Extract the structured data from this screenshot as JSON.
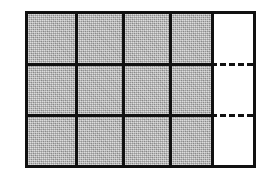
{
  "figure": {
    "name": "fraction-area-grid",
    "columns": 5,
    "rows": 3,
    "total_cells": 15,
    "shaded_cells": 12,
    "unshaded_cells": 3,
    "shaded_fraction": "12/15",
    "frame_color": "#111111",
    "shaded_color": "#bdbdbd",
    "unshaded_color": "#ffffff",
    "background_color": "#ffffff",
    "solid_divider_style": "solid",
    "dashed_divider_style": "dashed",
    "cells": [
      [
        {
          "id": "r1c1",
          "shaded": true,
          "divider_top": "none",
          "divider_left": "none"
        },
        {
          "id": "r1c2",
          "shaded": true,
          "divider_top": "none",
          "divider_left": "solid"
        },
        {
          "id": "r1c3",
          "shaded": true,
          "divider_top": "none",
          "divider_left": "solid"
        },
        {
          "id": "r1c4",
          "shaded": true,
          "divider_top": "none",
          "divider_left": "solid"
        },
        {
          "id": "r1c5",
          "shaded": false,
          "divider_top": "none",
          "divider_left": "solid"
        }
      ],
      [
        {
          "id": "r2c1",
          "shaded": true,
          "divider_top": "solid",
          "divider_left": "none"
        },
        {
          "id": "r2c2",
          "shaded": true,
          "divider_top": "solid",
          "divider_left": "solid"
        },
        {
          "id": "r2c3",
          "shaded": true,
          "divider_top": "solid",
          "divider_left": "solid"
        },
        {
          "id": "r2c4",
          "shaded": true,
          "divider_top": "solid",
          "divider_left": "solid"
        },
        {
          "id": "r2c5",
          "shaded": false,
          "divider_top": "dashed",
          "divider_left": "solid"
        }
      ],
      [
        {
          "id": "r3c1",
          "shaded": true,
          "divider_top": "solid",
          "divider_left": "none"
        },
        {
          "id": "r3c2",
          "shaded": true,
          "divider_top": "solid",
          "divider_left": "solid"
        },
        {
          "id": "r3c3",
          "shaded": true,
          "divider_top": "solid",
          "divider_left": "solid"
        },
        {
          "id": "r3c4",
          "shaded": true,
          "divider_top": "solid",
          "divider_left": "solid"
        },
        {
          "id": "r3c5",
          "shaded": false,
          "divider_top": "dashed",
          "divider_left": "solid"
        }
      ]
    ]
  }
}
